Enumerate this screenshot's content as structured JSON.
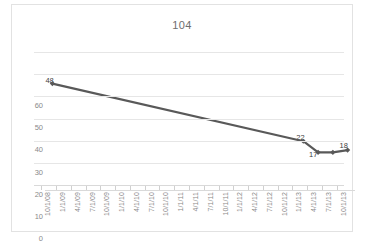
{
  "chart_data": {
    "type": "line",
    "title": "104",
    "xlabel": "",
    "ylabel": "",
    "ylim": [
      0,
      60
    ],
    "ytick_values": [
      0,
      10,
      20,
      30,
      40,
      50,
      60
    ],
    "ytick_labels": [
      "0",
      "10",
      "20",
      "30",
      "40",
      "50",
      "60"
    ],
    "grid": "horizontal",
    "legend": "none",
    "line_color": "#595959",
    "marker": "diamond",
    "marker_color": "#595959",
    "categories": [
      "10/1/08",
      "1/1/09",
      "4/1/09",
      "7/1/09",
      "10/1/09",
      "1/1/10",
      "4/1/10",
      "7/1/10",
      "10/1/10",
      "1/1/11",
      "4/1/11",
      "7/1/11",
      "10/1/11",
      "1/1/12",
      "4/1/12",
      "7/1/12",
      "10/1/12",
      "1/1/13",
      "4/1/13",
      "7/1/13",
      "10/1/13"
    ],
    "points": [
      {
        "category": "10/1/08",
        "index": 0,
        "value": 48,
        "label": "48"
      },
      {
        "category": "1/1/13",
        "index": 17,
        "value": 22,
        "label": "22"
      },
      {
        "category": "4/1/13",
        "index": 18,
        "value": 17,
        "label": "17"
      },
      {
        "category": "7/1/13",
        "index": 19,
        "value": 17,
        "label": ""
      },
      {
        "category": "10/1/13",
        "index": 20,
        "value": 18,
        "label": "18"
      }
    ],
    "series": [
      {
        "name": "104",
        "values": [
          48,
          null,
          null,
          null,
          null,
          null,
          null,
          null,
          null,
          null,
          null,
          null,
          null,
          null,
          null,
          null,
          null,
          22,
          17,
          17,
          18
        ]
      }
    ]
  }
}
